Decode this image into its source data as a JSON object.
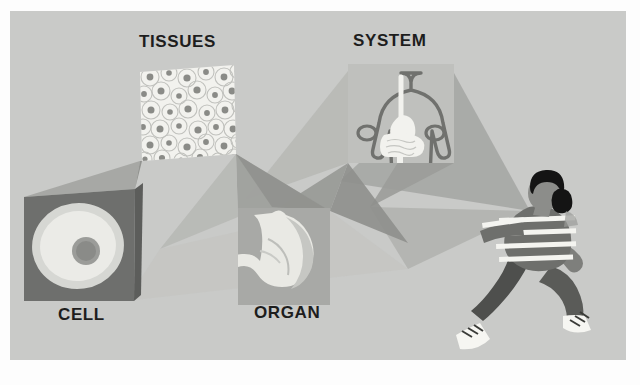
{
  "figure": {
    "type": "diagram",
    "background_color": "#c9cac8",
    "page_color": "#fdfdfd"
  },
  "labels": {
    "cell": "CELL",
    "tissues": "TISSUES",
    "organ": "ORGAN",
    "system": "SYSTEM"
  },
  "panels": [
    {
      "id": "cell",
      "label": "CELL",
      "content": "single cell with nucleus",
      "panel_color": "#6e6f6d",
      "cell_body_color": "#d8d9d5",
      "cell_inner_color": "#e9e9e5",
      "nucleus_color": "#8e8f8c"
    },
    {
      "id": "tissues",
      "label": "TISSUES",
      "content": "sheet of packed cells forming tissue",
      "panel_color": "#f2f2ee",
      "cell_outline_color": "#b9bab6",
      "nucleus_color": "#8a8b87"
    },
    {
      "id": "organ",
      "label": "ORGAN",
      "content": "stomach",
      "panel_color": "#a8a9a6",
      "organ_color": "#e6e6e1",
      "organ_shade_color": "#c2c3bf"
    },
    {
      "id": "system",
      "label": "SYSTEM",
      "content": "human torso with digestive system",
      "panel_color": "#bfc0bd",
      "outline_color": "#6f706d",
      "tract_color": "#f2f2ee"
    }
  ],
  "organism": {
    "id": "person",
    "description": "running person",
    "hair_color": "#141414",
    "skin_color": "#8c8d8a",
    "shirt_color": "#6e6f6c",
    "shirt_stripe_color": "#f4f4f0",
    "pants_color": "#4e4f4d",
    "shoe_color": "#f6f6f2"
  },
  "beams": [
    {
      "id": "beam-cell-to-tissues",
      "from": "tissues",
      "to": "cell",
      "color": "#8c8d8a"
    },
    {
      "id": "beam-tissues-to-organ",
      "from": "organ",
      "to": "tissues",
      "color": "#9fa09d"
    },
    {
      "id": "beam-organ-to-system",
      "from": "system",
      "to": "organ",
      "color": "#9a9b98"
    },
    {
      "id": "beam-system-to-person",
      "from": "person",
      "to": "system",
      "color": "#a5a6a3"
    }
  ],
  "sequence": [
    "CELL",
    "TISSUES",
    "ORGAN",
    "SYSTEM"
  ]
}
